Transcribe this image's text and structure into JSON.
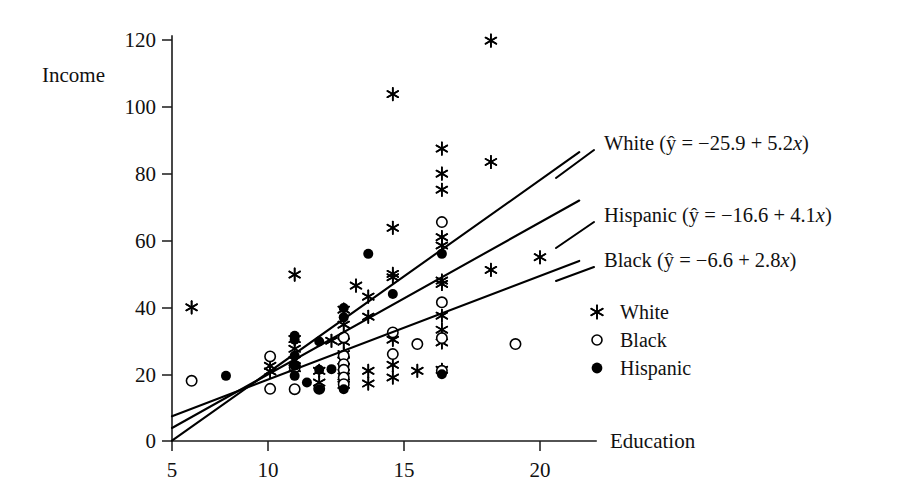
{
  "chart_data": {
    "type": "scatter",
    "title": "",
    "xlabel": "Education",
    "ylabel": "Income",
    "xlim": [
      4.2,
      22.4
    ],
    "ylim": [
      0,
      126
    ],
    "xticks": [
      5,
      10,
      15,
      20
    ],
    "yticks": [
      0,
      20,
      40,
      60,
      80,
      100,
      120
    ],
    "grid": false,
    "legend_position": "right-middle",
    "legend": [
      {
        "label": "White",
        "marker": "asterisk"
      },
      {
        "label": "Black",
        "marker": "open-circle"
      },
      {
        "label": "Hispanic",
        "marker": "filled-circle"
      }
    ],
    "annotations": [
      {
        "id": "white",
        "text": "White (ŷ = −25.9 + 5.2x)",
        "group": "White",
        "intercept": -25.9,
        "slope": 5.2
      },
      {
        "id": "hispanic",
        "text": "Hispanic (ŷ = −16.6 + 4.1x)",
        "group": "Hispanic",
        "intercept": -16.6,
        "slope": 4.1
      },
      {
        "id": "black",
        "text": "Black (ŷ = −6.6 + 2.8x)",
        "group": "Black",
        "intercept": -6.6,
        "slope": 2.8
      }
    ],
    "fit_lines": [
      {
        "name": "White",
        "intercept": -25.9,
        "slope": 5.2,
        "x_start": 5.0,
        "x_end": 21.6
      },
      {
        "name": "Hispanic",
        "intercept": -16.6,
        "slope": 4.1,
        "x_start": 5.0,
        "x_end": 21.6
      },
      {
        "name": "Black",
        "intercept": -6.6,
        "slope": 2.8,
        "x_start": 5.0,
        "x_end": 21.6
      }
    ],
    "series": [
      {
        "name": "White",
        "marker": "asterisk",
        "points": [
          [
            5.8,
            40.0
          ],
          [
            10.0,
            49.8
          ],
          [
            11.0,
            17.5
          ],
          [
            11.0,
            21.0
          ],
          [
            12.0,
            34.8
          ],
          [
            12.0,
            39.3
          ],
          [
            12.0,
            29.7
          ],
          [
            12.0,
            26.0
          ],
          [
            12.0,
            24.0
          ],
          [
            12.0,
            22.2
          ],
          [
            12.0,
            19.3
          ],
          [
            12.0,
            16.8
          ],
          [
            10.0,
            30.5
          ],
          [
            10.0,
            27.6
          ],
          [
            10.0,
            24.2
          ],
          [
            10.0,
            21.8
          ],
          [
            13.0,
            43.2
          ],
          [
            13.0,
            37.2
          ],
          [
            13.0,
            21.0
          ],
          [
            13.0,
            17.2
          ],
          [
            14.0,
            103.8
          ],
          [
            14.0,
            63.8
          ],
          [
            14.0,
            50.0
          ],
          [
            14.0,
            49.0
          ],
          [
            14.0,
            30.3
          ],
          [
            14.0,
            22.8
          ],
          [
            14.0,
            19.0
          ],
          [
            15.0,
            21.0
          ],
          [
            16.0,
            87.5
          ],
          [
            16.0,
            80.0
          ],
          [
            16.0,
            75.2
          ],
          [
            16.0,
            61.0
          ],
          [
            16.0,
            58.5
          ],
          [
            16.0,
            48.0
          ],
          [
            16.0,
            47.0
          ],
          [
            16.0,
            37.5
          ],
          [
            16.0,
            33.3
          ],
          [
            16.0,
            29.5
          ],
          [
            16.0,
            21.3
          ],
          [
            18.0,
            119.8
          ],
          [
            18.0,
            83.5
          ],
          [
            18.0,
            51.2
          ],
          [
            20.0,
            55.0
          ],
          [
            9.0,
            22.5
          ],
          [
            9.0,
            20.8
          ],
          [
            11.5,
            30.0
          ],
          [
            12.5,
            46.5
          ]
        ]
      },
      {
        "name": "Black",
        "marker": "open-circle",
        "points": [
          [
            5.8,
            18.0
          ],
          [
            9.0,
            25.3
          ],
          [
            9.0,
            15.6
          ],
          [
            10.0,
            15.5
          ],
          [
            10.0,
            22.0
          ],
          [
            12.0,
            31.0
          ],
          [
            12.0,
            25.5
          ],
          [
            12.0,
            23.0
          ],
          [
            12.0,
            21.3
          ],
          [
            12.0,
            19.0
          ],
          [
            12.0,
            17.0
          ],
          [
            14.0,
            32.5
          ],
          [
            14.0,
            26.0
          ],
          [
            15.0,
            29.0
          ],
          [
            16.0,
            65.5
          ],
          [
            16.0,
            41.5
          ],
          [
            16.0,
            30.8
          ],
          [
            16.0,
            21.0
          ],
          [
            19.0,
            29.0
          ],
          [
            11.0,
            15.6
          ]
        ]
      },
      {
        "name": "Hispanic",
        "marker": "filled-circle",
        "points": [
          [
            7.2,
            19.5
          ],
          [
            10.0,
            31.5
          ],
          [
            10.0,
            30.3
          ],
          [
            10.0,
            25.5
          ],
          [
            10.0,
            22.5
          ],
          [
            10.0,
            19.5
          ],
          [
            11.0,
            29.8
          ],
          [
            11.0,
            21.3
          ],
          [
            11.0,
            15.5
          ],
          [
            11.5,
            21.5
          ],
          [
            12.0,
            39.8
          ],
          [
            12.0,
            37.0
          ],
          [
            13.0,
            56.0
          ],
          [
            14.0,
            44.0
          ],
          [
            16.0,
            56.0
          ],
          [
            16.0,
            20.0
          ],
          [
            10.5,
            17.5
          ],
          [
            12.0,
            15.5
          ]
        ]
      }
    ]
  },
  "axes": {
    "y_label": "Income",
    "x_label": "Education",
    "y_tick_labels": [
      "0",
      "20",
      "40",
      "60",
      "80",
      "100",
      "120"
    ],
    "x_tick_labels": [
      "5",
      "10",
      "15",
      "20"
    ]
  },
  "equations": {
    "white": "White (ŷ = −25.9 + 5.2x)",
    "white_name": "White",
    "white_body": "(ŷ = −25.9 + 5.2",
    "hispanic": "Hispanic (ŷ = −16.6 + 4.1x)",
    "hispanic_name": "Hispanic",
    "hispanic_body": "(ŷ = −16.6 + 4.1",
    "black": "Black (ŷ = −6.6 + 2.8x)",
    "black_name": "Black",
    "black_body": "(ŷ = −6.6 + 2.8",
    "x_var": "x",
    "close_paren": ")"
  },
  "legend": {
    "white_label": "White",
    "black_label": "Black",
    "hispanic_label": "Hispanic"
  },
  "colors": {
    "ink": "#111111",
    "line": "#000000",
    "background": "#ffffff"
  }
}
